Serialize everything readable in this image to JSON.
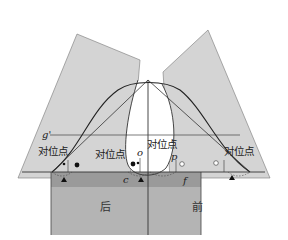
{
  "diagram": {
    "labels": {
      "g_prime": "g'",
      "contra_left_outer": "对位点",
      "contra_left_inner": "对位点",
      "contra_center": "对位点",
      "contra_right_outer": "对位点",
      "point_o": "o",
      "point_p": "p",
      "point_c": "c",
      "point_f": "f",
      "back": "后",
      "front": "前"
    },
    "colors": {
      "light_panel": "#d4d4d4",
      "mid_band": "#9a9a9a",
      "lower_block": "#b4b4b4",
      "line": "#333333"
    }
  }
}
